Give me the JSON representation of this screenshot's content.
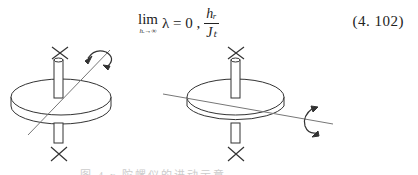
{
  "equation": {
    "lim_word": "lim",
    "lim_sub": "hᵣ→∞",
    "lhs": "λ = 0 ,",
    "frac_num": "hᵣ",
    "frac_den": "Jₜ",
    "number": "(4. 102)"
  },
  "figure": {
    "panels": [
      {
        "name": "left-gyroscope",
        "rotation_axis": "tilted-diagonal",
        "arrow": "curved-double-arrow-top-right"
      },
      {
        "name": "right-gyroscope",
        "rotation_axis": "near-horizontal",
        "arrow": "curved-double-arrow-right"
      }
    ],
    "caption": "图 4.x  陀螺仪的进动示意"
  }
}
